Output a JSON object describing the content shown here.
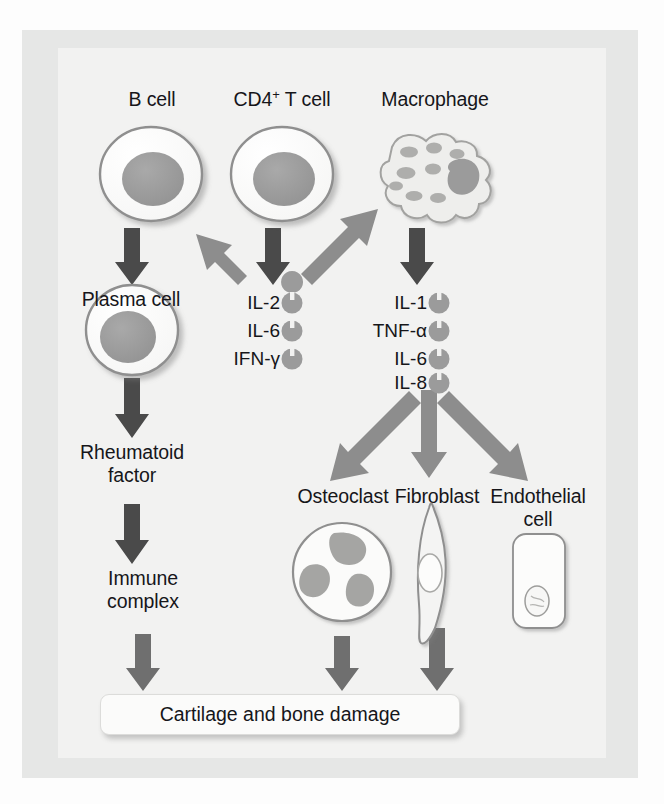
{
  "figure": {
    "type": "biological-pathway-diagram",
    "colors": {
      "page_background": "#fdfdfd",
      "outer_panel": "#e6e7e6",
      "inner_panel": "#f2f2f1",
      "arrow_dark": "#4a4a4a",
      "arrow_medium": "#6f6f6f",
      "arrow_light": "#8d8d8d",
      "cell_fill": "#fbfbfa",
      "cell_outline": "#8f8f8f",
      "nucleus_fill": "#9b9b9b",
      "text": "#16161a"
    }
  },
  "cells": {
    "b_cell": {
      "label": "B cell"
    },
    "t_cell": {
      "label_main": "CD4",
      "label_sup": "+",
      "label_tail": " T cell"
    },
    "macrophage": {
      "label": "Macrophage"
    },
    "plasma_cell": {
      "label": "Plasma cell"
    },
    "osteoclast": {
      "label": "Osteoclast"
    },
    "fibroblast": {
      "label": "Fibroblast"
    },
    "endothelial": {
      "label_line1": "Endothelial",
      "label_line2": "cell"
    }
  },
  "mediators": {
    "t_cell_cytokines": {
      "items": [
        "IL-2",
        "IL-6",
        "IFN-γ"
      ]
    },
    "macrophage_cytokines": {
      "items": [
        "IL-1",
        "TNF-α",
        "IL-6",
        "IL-8"
      ]
    }
  },
  "products": {
    "rheumatoid_factor": {
      "line1": "Rheumatoid",
      "line2": "factor"
    },
    "immune_complex": {
      "line1": "Immune",
      "line2": "complex"
    }
  },
  "outcome": {
    "label": "Cartilage and bone damage"
  },
  "edges": [
    {
      "from": "B cell",
      "to": "Plasma cell",
      "style": "dark"
    },
    {
      "from": "CD4+ T cell",
      "to": "IL-2 / IL-6 / IFN-γ",
      "style": "dark"
    },
    {
      "from": "IL-2 / IL-6 / IFN-γ",
      "to": "B cell",
      "style": "light"
    },
    {
      "from": "IL-2 / IL-6 / IFN-γ",
      "to": "Macrophage",
      "style": "light"
    },
    {
      "from": "Macrophage",
      "to": "IL-1 / TNF-α / IL-6 / IL-8",
      "style": "dark"
    },
    {
      "from": "Plasma cell",
      "to": "Rheumatoid factor",
      "style": "dark"
    },
    {
      "from": "Rheumatoid factor",
      "to": "Immune complex",
      "style": "dark"
    },
    {
      "from": "Immune complex",
      "to": "Cartilage and bone damage",
      "style": "medium"
    },
    {
      "from": "IL-1 / TNF-α / IL-6 / IL-8",
      "to": "Osteoclast",
      "style": "light"
    },
    {
      "from": "IL-1 / TNF-α / IL-6 / IL-8",
      "to": "Fibroblast",
      "style": "light"
    },
    {
      "from": "IL-1 / TNF-α / IL-6 / IL-8",
      "to": "Endothelial cell",
      "style": "light"
    },
    {
      "from": "Osteoclast",
      "to": "Cartilage and bone damage",
      "style": "medium"
    },
    {
      "from": "Fibroblast",
      "to": "Cartilage and bone damage",
      "style": "medium"
    }
  ]
}
